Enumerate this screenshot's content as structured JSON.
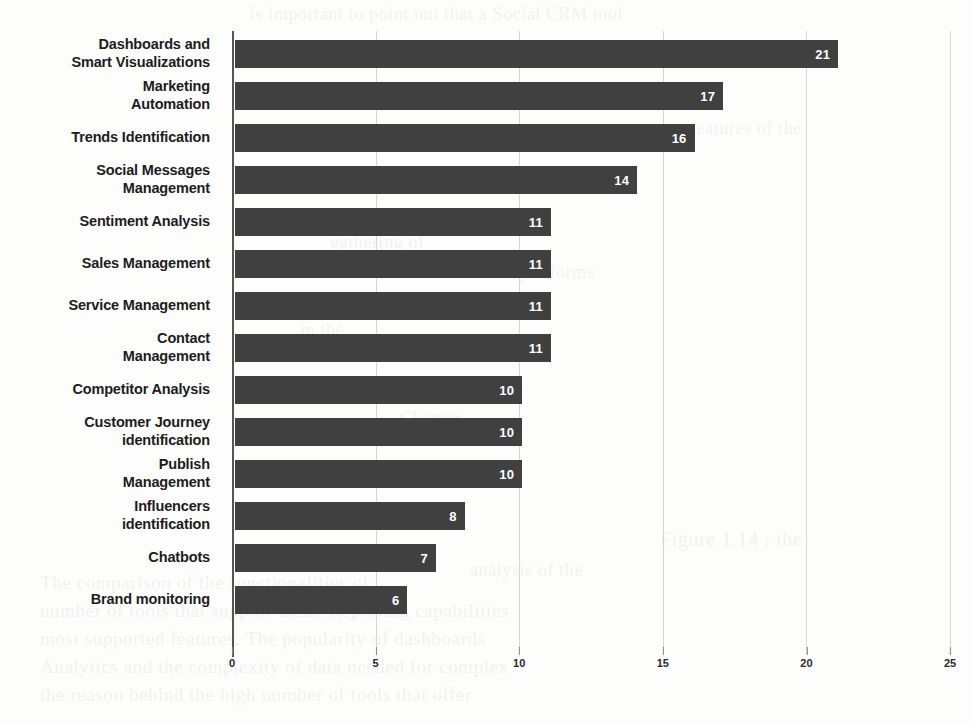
{
  "chart_data": {
    "type": "bar",
    "orientation": "horizontal",
    "title": "",
    "subtitle": "",
    "xlabel": "",
    "ylabel": "",
    "xlim": [
      0,
      25
    ],
    "xticks": [
      0,
      5,
      10,
      15,
      20,
      25
    ],
    "grid": true,
    "legend": false,
    "legend_position": "none",
    "bar_color": "#404040",
    "value_label_color": "#ffffff",
    "categories": [
      "Dashboards and\nSmart Visualizations",
      "Marketing\nAutomation",
      "Trends Identification",
      "Social Messages\nManagement",
      "Sentiment Analysis",
      "Sales Management",
      "Service Management",
      "Contact\nManagement",
      "Competitor Analysis",
      "Customer Journey\nidentification",
      "Publish\nManagement",
      "Influencers\nidentification",
      "Chatbots",
      "Brand monitoring"
    ],
    "values": [
      21,
      17,
      16,
      14,
      11,
      11,
      11,
      11,
      10,
      10,
      10,
      8,
      7,
      6
    ],
    "bars": [
      {
        "label": "Dashboards and Smart Visualizations",
        "label_lines": [
          "Dashboards and",
          "Smart Visualizations"
        ],
        "value": 21
      },
      {
        "label": "Marketing Automation",
        "label_lines": [
          "Marketing",
          "Automation"
        ],
        "value": 17
      },
      {
        "label": "Trends Identification",
        "label_lines": [
          "Trends Identification"
        ],
        "value": 16
      },
      {
        "label": "Social Messages Management",
        "label_lines": [
          "Social Messages",
          "Management"
        ],
        "value": 14
      },
      {
        "label": "Sentiment Analysis",
        "label_lines": [
          "Sentiment Analysis"
        ],
        "value": 11
      },
      {
        "label": "Sales Management",
        "label_lines": [
          "Sales Management"
        ],
        "value": 11
      },
      {
        "label": "Service Management",
        "label_lines": [
          "Service Management"
        ],
        "value": 11
      },
      {
        "label": "Contact Management",
        "label_lines": [
          "Contact",
          "Management"
        ],
        "value": 11
      },
      {
        "label": "Competitor Analysis",
        "label_lines": [
          "Competitor Analysis"
        ],
        "value": 10
      },
      {
        "label": "Customer Journey identification",
        "label_lines": [
          "Customer Journey",
          "identification"
        ],
        "value": 10
      },
      {
        "label": "Publish Management",
        "label_lines": [
          "Publish",
          "Management"
        ],
        "value": 10
      },
      {
        "label": "Influencers identification",
        "label_lines": [
          "Influencers",
          "identification"
        ],
        "value": 8
      },
      {
        "label": "Chatbots",
        "label_lines": [
          "Chatbots"
        ],
        "value": 7
      },
      {
        "label": "Brand monitoring",
        "label_lines": [
          "Brand monitoring"
        ],
        "value": 6
      }
    ]
  },
  "background_bleed": [
    {
      "text": "is important to point out that a Social CRM tool",
      "x": 250,
      "y": 4,
      "size": 18
    },
    {
      "text": "features of the",
      "x": 690,
      "y": 118,
      "size": 18
    },
    {
      "text": "gathering of",
      "x": 330,
      "y": 232,
      "size": 18
    },
    {
      "text": "platforms",
      "x": 520,
      "y": 262,
      "size": 18
    },
    {
      "text": "in the",
      "x": 300,
      "y": 320,
      "size": 18
    },
    {
      "text": "Chapter",
      "x": 400,
      "y": 408,
      "size": 18
    },
    {
      "text": "analysis of the",
      "x": 470,
      "y": 560,
      "size": 18
    },
    {
      "text": "Figure 1.14 : the",
      "x": 660,
      "y": 528,
      "size": 20
    },
    {
      "text": "The comparison of the functionalities of",
      "x": 40,
      "y": 572,
      "size": 19
    },
    {
      "text": "number of tools that support them. Reporting capabilities",
      "x": 40,
      "y": 600,
      "size": 19
    },
    {
      "text": "most supported features. The popularity of dashboards",
      "x": 40,
      "y": 628,
      "size": 19
    },
    {
      "text": "Analytics and the complexity of data needed for complex",
      "x": 40,
      "y": 656,
      "size": 19
    },
    {
      "text": "the reason behind the high number of tools that offer",
      "x": 40,
      "y": 684,
      "size": 19
    }
  ]
}
